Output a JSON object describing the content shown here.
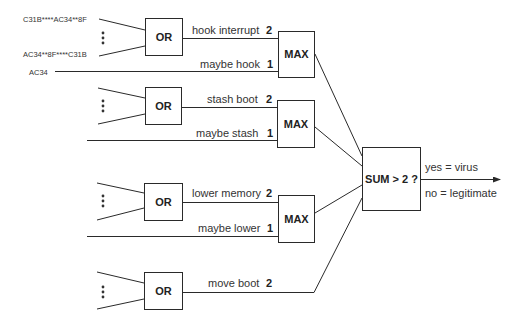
{
  "inputs": {
    "signature_1": "C31B****AC34**8F",
    "signature_2": "AC34**8F****C31B",
    "signature_3": "AC34"
  },
  "or_gates": [
    {
      "label": "OR",
      "output_label": "hook interrupt",
      "weight": "2"
    },
    {
      "label": "OR",
      "output_label": "stash boot",
      "weight": "2"
    },
    {
      "label": "OR",
      "output_label": "lower memory",
      "weight": "2"
    },
    {
      "label": "OR",
      "output_label": "move boot",
      "weight": "2"
    }
  ],
  "maybe_lines": [
    {
      "label": "maybe hook",
      "weight": "1"
    },
    {
      "label": "maybe stash",
      "weight": "1"
    },
    {
      "label": "maybe lower",
      "weight": "1"
    }
  ],
  "max_gates": [
    {
      "label": "MAX"
    },
    {
      "label": "MAX"
    },
    {
      "label": "MAX"
    }
  ],
  "sum_gate": {
    "label": "SUM > 2 ?"
  },
  "outputs": {
    "yes": "yes = virus",
    "no": "no = legitimate"
  },
  "colors": {
    "line": "#2a2a2a",
    "text": "#333333",
    "background": "#ffffff"
  }
}
